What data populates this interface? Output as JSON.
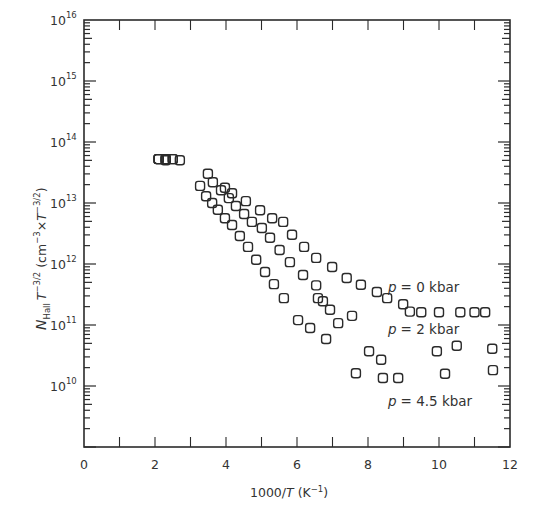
{
  "chart_data": {
    "type": "scatter",
    "title": "",
    "xlabel": "1000/T (K⁻¹)",
    "ylabel": "N_Hall T^-3/2 (cm^-3 × T^-3/2)",
    "xlim": [
      0,
      12
    ],
    "ylim_log10": [
      9,
      16
    ],
    "yscale": "log",
    "grid": false,
    "legend_position": "inline annotations",
    "x_ticks": [
      "0",
      "2",
      "4",
      "6",
      "8",
      "10",
      "12"
    ],
    "y_ticks": [
      "10^10",
      "10^11",
      "10^12",
      "10^13",
      "10^14",
      "10^15",
      "10^16"
    ],
    "marker": "open square",
    "series": [
      {
        "name": "p = 0 kbar",
        "x": [
          2.1,
          2.3,
          2.5,
          2.7,
          3.97,
          4.17,
          4.56,
          4.96,
          5.3,
          5.61,
          5.86,
          6.2,
          6.54,
          6.99,
          7.4,
          7.8,
          8.25,
          8.54,
          8.99,
          9.18,
          9.5,
          10.0,
          10.6,
          11.0,
          11.3
        ],
        "log10y": [
          13.72,
          13.72,
          13.72,
          13.7,
          13.25,
          13.16,
          13.03,
          12.88,
          12.75,
          12.69,
          12.48,
          12.28,
          12.1,
          11.95,
          11.77,
          11.66,
          11.54,
          11.44,
          11.34,
          11.22,
          11.21,
          11.21,
          11.21,
          11.21,
          11.21
        ]
      },
      {
        "name": "p = 2 kbar",
        "x": [
          2.1,
          2.3,
          2.5,
          3.49,
          3.63,
          3.86,
          4.08,
          4.28,
          4.51,
          4.73,
          5.01,
          5.24,
          5.51,
          5.8,
          6.17,
          6.54,
          6.59,
          6.73,
          6.93,
          7.16,
          7.55,
          8.03,
          8.37,
          9.94,
          10.5,
          11.5
        ],
        "log10y": [
          13.72,
          13.72,
          13.72,
          13.48,
          13.34,
          13.21,
          13.08,
          12.95,
          12.82,
          12.69,
          12.59,
          12.43,
          12.23,
          12.03,
          11.82,
          11.65,
          11.44,
          11.39,
          11.25,
          11.03,
          11.15,
          10.57,
          10.43,
          10.57,
          10.66,
          10.61
        ]
      },
      {
        "name": "p = 4.5 kbar",
        "x": [
          2.1,
          2.3,
          3.27,
          3.44,
          3.61,
          3.77,
          3.97,
          4.17,
          4.39,
          4.62,
          4.85,
          5.1,
          5.35,
          5.63,
          6.03,
          6.37,
          6.82,
          7.66,
          8.42,
          8.85,
          10.17,
          11.52
        ],
        "log10y": [
          13.72,
          13.7,
          13.28,
          13.11,
          13.0,
          12.89,
          12.75,
          12.64,
          12.46,
          12.28,
          12.07,
          11.87,
          11.67,
          11.44,
          11.08,
          10.95,
          10.77,
          10.21,
          10.13,
          10.13,
          10.2,
          10.26
        ]
      }
    ],
    "annotations": [
      {
        "text_italic": "p",
        "text": " = 0 kbar",
        "x": 8.5,
        "log10y": 11.7
      },
      {
        "text_italic": "p",
        "text": " = 2 kbar",
        "x": 8.5,
        "log10y": 10.92
      },
      {
        "text_italic": "p",
        "text": " = 4.5 kbar",
        "x": 8.5,
        "log10y": 9.92
      }
    ]
  },
  "axes": {
    "x_title_main": "1000/",
    "x_title_var": "T",
    "x_title_unit": " (K",
    "x_title_exp": "−1",
    "x_title_close": ")",
    "y_title_N": "N",
    "y_title_sub": "Hall",
    "y_title_T": "T",
    "y_title_exp1": "−3/2",
    "y_title_unit": " (cm",
    "y_title_exp2": "−3",
    "y_title_x": "×",
    "y_title_T2": "T",
    "y_title_exp3": "−3/2",
    "y_title_close": ")"
  },
  "labels": {
    "p0": "= 0 kbar",
    "p2": "= 2 kbar",
    "p45": "= 4.5 kbar",
    "p": "p"
  }
}
